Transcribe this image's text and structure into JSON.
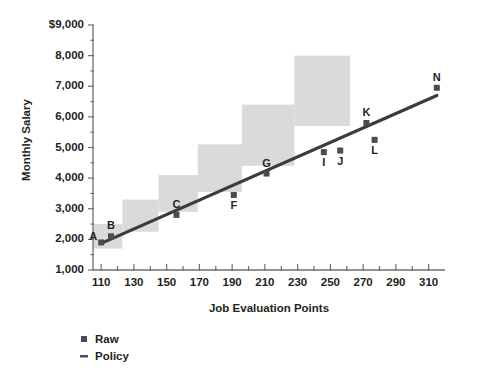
{
  "chart_data": {
    "type": "scatter",
    "title": "",
    "xlabel": "Job Evaluation Points",
    "ylabel": "Monthly Salary",
    "xlim": [
      105,
      320
    ],
    "ylim": [
      1000,
      9000
    ],
    "grid": false,
    "x_ticks": [
      110,
      130,
      150,
      170,
      190,
      210,
      230,
      250,
      270,
      290,
      310
    ],
    "x_tick_labels": [
      "110",
      "130",
      "150",
      "170",
      "190",
      "210",
      "230",
      "250",
      "270",
      "290",
      "310"
    ],
    "x_minor_step": 10,
    "y_ticks": [
      1000,
      2000,
      3000,
      4000,
      5000,
      6000,
      7000,
      8000,
      9000
    ],
    "y_tick_labels": [
      "1,000",
      "2,000",
      "3,000",
      "4,000",
      "5,000",
      "6,000",
      "7,000",
      "8,000",
      "$9,000"
    ],
    "legend_position": "below-left",
    "legend": [
      {
        "name": "Raw",
        "marker": "square",
        "color": "#4c4c4e"
      },
      {
        "name": "Policy",
        "marker": "line",
        "color": "#4c4c4e"
      }
    ],
    "series": [
      {
        "name": "Raw",
        "type": "scatter",
        "marker": "square",
        "color": "#4c4c4e",
        "points": [
          {
            "label": "A",
            "x": 110,
            "y": 1900,
            "label_pos": "left"
          },
          {
            "label": "B",
            "x": 116,
            "y": 2100,
            "label_pos": "above"
          },
          {
            "label": "C",
            "x": 156,
            "y": 2800,
            "label_pos": "above"
          },
          {
            "label": "F",
            "x": 191,
            "y": 3450,
            "label_pos": "below"
          },
          {
            "label": "G",
            "x": 211,
            "y": 4150,
            "label_pos": "above"
          },
          {
            "label": "I",
            "x": 246,
            "y": 4850,
            "label_pos": "below"
          },
          {
            "label": "J",
            "x": 256,
            "y": 4900,
            "label_pos": "below"
          },
          {
            "label": "K",
            "x": 272,
            "y": 5800,
            "label_pos": "above"
          },
          {
            "label": "L",
            "x": 277,
            "y": 5250,
            "label_pos": "below"
          },
          {
            "label": "N",
            "x": 315,
            "y": 6950,
            "label_pos": "above"
          }
        ]
      },
      {
        "name": "Policy",
        "type": "line",
        "color": "#3b3b3d",
        "x": [
          110,
          315
        ],
        "y": [
          1870,
          6700
        ]
      }
    ],
    "grade_bands": [
      {
        "x_start": 105,
        "x_end": 123,
        "y_min": 1700,
        "y_max": 2500,
        "color": "#d9dada"
      },
      {
        "x_start": 123,
        "x_end": 145,
        "y_min": 2250,
        "y_max": 3300,
        "color": "#d9dada"
      },
      {
        "x_start": 145,
        "x_end": 169,
        "y_min": 2900,
        "y_max": 4100,
        "color": "#d9dada"
      },
      {
        "x_start": 169,
        "x_end": 196,
        "y_min": 3550,
        "y_max": 5100,
        "color": "#d9dada"
      },
      {
        "x_start": 196,
        "x_end": 228,
        "y_min": 4400,
        "y_max": 6400,
        "color": "#d9dada"
      },
      {
        "x_start": 228,
        "x_end": 262,
        "y_min": 5700,
        "y_max": 8000,
        "color": "#d9dada"
      }
    ]
  },
  "legend_items": {
    "raw": "Raw",
    "policy": "Policy"
  },
  "axis_titles": {
    "x": "Job Evaluation Points",
    "y": "Monthly Salary"
  }
}
